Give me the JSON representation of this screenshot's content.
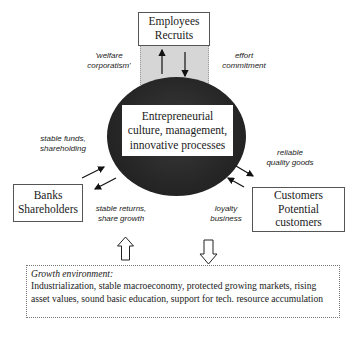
{
  "nodes": {
    "employees": {
      "lines": [
        "Employees",
        "Recruits"
      ]
    },
    "core": {
      "lines": [
        "Entrepreneurial",
        "culture, management,",
        "innovative processes"
      ]
    },
    "banks": {
      "lines": [
        "Banks",
        "Shareholders"
      ]
    },
    "customers": {
      "lines": [
        "Customers",
        "Potential",
        "customers"
      ]
    }
  },
  "edge_labels": {
    "welfare": [
      "'welfare",
      "corporatism'"
    ],
    "effort": [
      "effort",
      "commitment"
    ],
    "stable_funds": [
      "stable funds,",
      "shareholding"
    ],
    "stable_returns": [
      "stable returns,",
      "share growth"
    ],
    "reliable": [
      "reliable",
      "quality goods"
    ],
    "loyalty": [
      "loyalty",
      "business"
    ]
  },
  "growth": {
    "title": "Growth environment:",
    "body": "Industrialization, stable macroeconomy, protected growing markets, rising asset values, sound basic education,  support for tech. resource accumulation"
  },
  "colors": {
    "core_fill": "#262626",
    "band_fill": "#d6d6d6",
    "border": "#555555"
  }
}
